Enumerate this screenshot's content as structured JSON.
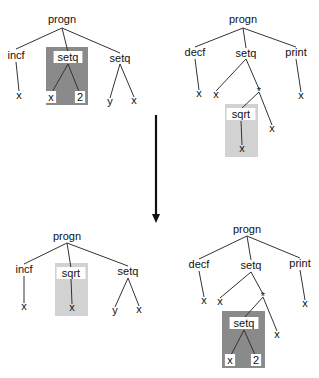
{
  "header_fragment": "",
  "colors": {
    "highlight_dark": "#8a8a8a",
    "highlight_light": "#d2d2d2",
    "edge": "#333333",
    "arrow": "#111111"
  },
  "trees": [
    {
      "id": "before-left",
      "nodes": [
        {
          "id": "n0",
          "label": "progn"
        },
        {
          "id": "n1",
          "label": "incf",
          "parent": "n0"
        },
        {
          "id": "n2",
          "label": "setq",
          "parent": "n0",
          "highlight": "dark",
          "boxed_label": true
        },
        {
          "id": "n3",
          "label": "setq",
          "parent": "n0"
        },
        {
          "id": "n4",
          "label": "x",
          "parent": "n1"
        },
        {
          "id": "n5",
          "label": "x",
          "parent": "n2",
          "boxed_label": true
        },
        {
          "id": "n6",
          "label": "2",
          "parent": "n2",
          "boxed_label": true
        },
        {
          "id": "n7",
          "label": "y",
          "parent": "n3"
        },
        {
          "id": "n8",
          "label": "x",
          "parent": "n3"
        }
      ]
    },
    {
      "id": "before-right",
      "nodes": [
        {
          "id": "m0",
          "label": "progn"
        },
        {
          "id": "m1",
          "label": "decf",
          "parent": "m0"
        },
        {
          "id": "m2",
          "label": "setq",
          "parent": "m0"
        },
        {
          "id": "m3",
          "label": "print",
          "parent": "m0"
        },
        {
          "id": "m4",
          "label": "x",
          "parent": "m1"
        },
        {
          "id": "m5",
          "label": "x",
          "parent": "m2"
        },
        {
          "id": "m6",
          "label": "*",
          "parent": "m2"
        },
        {
          "id": "m7",
          "label": "x",
          "parent": "m3"
        },
        {
          "id": "m8",
          "label": "sqrt",
          "parent": "m6",
          "highlight": "light",
          "boxed_label": true
        },
        {
          "id": "m9",
          "label": "x",
          "parent": "m6"
        },
        {
          "id": "m10",
          "label": "x",
          "parent": "m8"
        }
      ]
    },
    {
      "id": "after-left",
      "nodes": [
        {
          "id": "p0",
          "label": "progn"
        },
        {
          "id": "p1",
          "label": "incf",
          "parent": "p0"
        },
        {
          "id": "p2",
          "label": "sqrt",
          "parent": "p0",
          "highlight": "light",
          "boxed_label": true
        },
        {
          "id": "p3",
          "label": "setq",
          "parent": "p0"
        },
        {
          "id": "p4",
          "label": "x",
          "parent": "p1"
        },
        {
          "id": "p5",
          "label": "x",
          "parent": "p2"
        },
        {
          "id": "p6",
          "label": "y",
          "parent": "p3"
        },
        {
          "id": "p7",
          "label": "x",
          "parent": "p3"
        }
      ]
    },
    {
      "id": "after-right",
      "nodes": [
        {
          "id": "q0",
          "label": "progn"
        },
        {
          "id": "q1",
          "label": "decf",
          "parent": "q0"
        },
        {
          "id": "q2",
          "label": "setq",
          "parent": "q0"
        },
        {
          "id": "q3",
          "label": "print",
          "parent": "q0"
        },
        {
          "id": "q4",
          "label": "x",
          "parent": "q1"
        },
        {
          "id": "q5",
          "label": "x",
          "parent": "q2"
        },
        {
          "id": "q6",
          "label": "*",
          "parent": "q2"
        },
        {
          "id": "q7",
          "label": "x",
          "parent": "q3"
        },
        {
          "id": "q8",
          "label": "setq",
          "parent": "q6",
          "highlight": "dark",
          "boxed_label": true
        },
        {
          "id": "q9",
          "label": "x",
          "parent": "q6"
        },
        {
          "id": "q10",
          "label": "x",
          "parent": "q8",
          "boxed_label": true
        },
        {
          "id": "q11",
          "label": "2",
          "parent": "q8",
          "boxed_label": true
        }
      ]
    }
  ],
  "transition": {
    "meaning": "crossover: subtrees swapped between parents",
    "direction": "down"
  }
}
